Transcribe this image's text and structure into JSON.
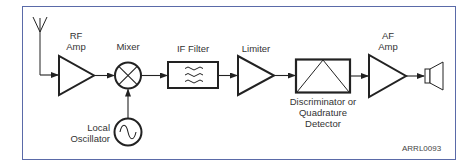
{
  "diagram": {
    "figure_code": "ARRL0093",
    "colors": {
      "frame": "#5a6aa8",
      "stroke": "#222222",
      "text": "#333333"
    },
    "blocks": [
      {
        "id": "antenna",
        "icon": "antenna-icon"
      },
      {
        "id": "rf_amp",
        "label_line1": "RF",
        "label_line2": "Amp",
        "icon": "amplifier-triangle-icon"
      },
      {
        "id": "mixer",
        "label": "Mixer",
        "icon": "mixer-x-circle-icon"
      },
      {
        "id": "local_osc",
        "label_line1": "Local",
        "label_line2": "Oscillator",
        "icon": "sine-wave-circle-icon"
      },
      {
        "id": "if_filter",
        "label": "IF Filter",
        "icon": "filter-waves-icon"
      },
      {
        "id": "limiter",
        "label": "Limiter",
        "icon": "amplifier-triangle-icon"
      },
      {
        "id": "discriminator",
        "label_line1": "Discriminator or",
        "label_line2": "Quadrature",
        "label_line3": "Detector",
        "icon": "detector-box-icon"
      },
      {
        "id": "af_amp",
        "label_line1": "AF",
        "label_line2": "Amp",
        "icon": "amplifier-triangle-icon"
      },
      {
        "id": "speaker",
        "icon": "speaker-icon"
      }
    ],
    "connections": [
      [
        "antenna",
        "rf_amp"
      ],
      [
        "rf_amp",
        "mixer"
      ],
      [
        "local_osc",
        "mixer"
      ],
      [
        "mixer",
        "if_filter"
      ],
      [
        "if_filter",
        "limiter"
      ],
      [
        "limiter",
        "discriminator"
      ],
      [
        "discriminator",
        "af_amp"
      ],
      [
        "af_amp",
        "speaker"
      ]
    ]
  }
}
